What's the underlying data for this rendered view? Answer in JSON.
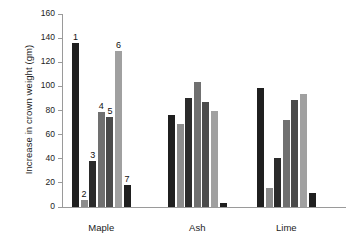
{
  "chart_data": {
    "type": "bar",
    "title": "",
    "subtitle": "",
    "xlabel": "",
    "ylabel": "Increase in crown weight (gm)",
    "ylim": [
      0,
      160
    ],
    "yticks": [
      0,
      20,
      40,
      60,
      80,
      100,
      120,
      140,
      160
    ],
    "ytick_labels": [
      "0",
      "20",
      "40",
      "60",
      "80",
      "100",
      "120",
      "140",
      "160"
    ],
    "grid": false,
    "legend": "none",
    "categories": [
      "Maple",
      "Ash",
      "Lime"
    ],
    "treatment_labels": [
      "1",
      "2",
      "3",
      "4",
      "5",
      "6",
      "7"
    ],
    "annotations": [
      "1",
      "2",
      "3",
      "4",
      "5",
      "6",
      "7"
    ],
    "annotated_group": "Maple",
    "series": [
      {
        "name": "1",
        "values": [
          136,
          76,
          99
        ],
        "color": "#1f1f1f"
      },
      {
        "name": "2",
        "values": [
          6,
          69,
          16
        ],
        "color": "#8c8c8c"
      },
      {
        "name": "3",
        "values": [
          38,
          90,
          41
        ],
        "color": "#2b2b2b"
      },
      {
        "name": "4",
        "values": [
          79,
          104,
          72
        ],
        "color": "#707070"
      },
      {
        "name": "5",
        "values": [
          75,
          87,
          89
        ],
        "color": "#4a4a4a"
      },
      {
        "name": "6",
        "values": [
          129,
          80,
          94
        ],
        "color": "#a0a0a0"
      },
      {
        "name": "7",
        "values": [
          18,
          3,
          12
        ],
        "color": "#1f1f1f"
      }
    ]
  },
  "axis": {
    "y_title": "Increase in crown weight (gm)"
  },
  "groups": [
    {
      "label": "Maple"
    },
    {
      "label": "Ash"
    },
    {
      "label": "Lime"
    }
  ]
}
